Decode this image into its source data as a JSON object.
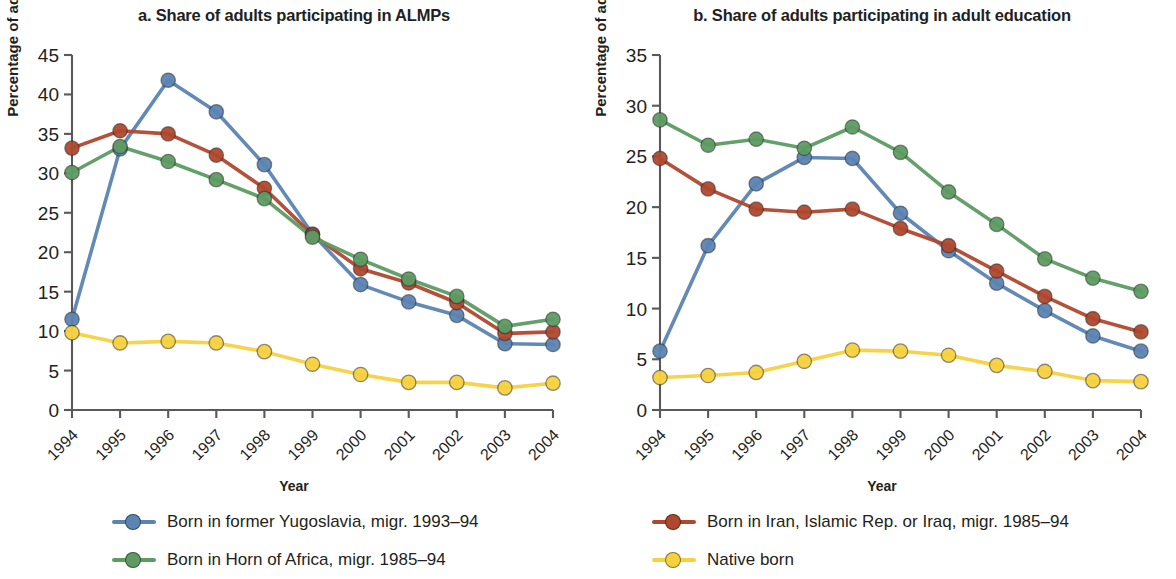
{
  "figure": {
    "background": "#ffffff",
    "xlabel": "Year",
    "ylabel": "Percentage of adults"
  },
  "series_colors": {
    "yugoslavia": "#5b84b3",
    "iran_iraq": "#b0482f",
    "horn_africa": "#5d9b63",
    "native": "#f6d13f"
  },
  "legend": {
    "items": [
      {
        "key": "yugoslavia",
        "label": "Born in former Yugoslavia, migr. 1993–94",
        "color": "#5b84b3"
      },
      {
        "key": "iran_iraq",
        "label": "Born in Iran, Islamic Rep. or Iraq, migr. 1985–94",
        "color": "#b0482f"
      },
      {
        "key": "horn_africa",
        "label": "Born in Horn of Africa, migr. 1985–94",
        "color": "#5d9b63"
      },
      {
        "key": "native",
        "label": "Native born",
        "color": "#f6d13f"
      }
    ]
  },
  "panels": [
    {
      "id": "a",
      "title": "a. Share of adults participating in ALMPs"
    },
    {
      "id": "b",
      "title": "b. Share of adults participating in adult education"
    }
  ],
  "chart_data": [
    {
      "type": "line",
      "title": "a. Share of adults participating in ALMPs",
      "xlabel": "Year",
      "ylabel": "Percentage of adults",
      "categories": [
        "1994",
        "1995",
        "1996",
        "1997",
        "1998",
        "1999",
        "2000",
        "2001",
        "2002",
        "2003",
        "2004"
      ],
      "x": [
        1994,
        1995,
        1996,
        1997,
        1998,
        1999,
        2000,
        2001,
        2002,
        2003,
        2004
      ],
      "ylim": [
        0,
        45
      ],
      "yticks": [
        0,
        5,
        10,
        15,
        20,
        25,
        30,
        35,
        40,
        45
      ],
      "grid": false,
      "legend_position": "bottom",
      "series": [
        {
          "name": "Born in former Yugoslavia, migr. 1993–94",
          "color": "#5b84b3",
          "values": [
            11.5,
            33.1,
            41.8,
            37.8,
            31.1,
            22.3,
            15.9,
            13.7,
            12.0,
            8.4,
            8.3
          ]
        },
        {
          "name": "Born in Iran, Islamic Rep. or Iraq, migr. 1985–94",
          "color": "#b0482f",
          "values": [
            33.2,
            35.4,
            35.0,
            32.3,
            28.1,
            22.2,
            17.9,
            16.1,
            13.6,
            9.7,
            9.9
          ]
        },
        {
          "name": "Born in Horn of Africa, migr. 1985–94",
          "color": "#5d9b63",
          "values": [
            30.1,
            33.4,
            31.5,
            29.2,
            26.8,
            21.9,
            19.1,
            16.6,
            14.4,
            10.6,
            11.5
          ]
        },
        {
          "name": "Native born",
          "color": "#f6d13f",
          "values": [
            9.8,
            8.5,
            8.7,
            8.5,
            7.4,
            5.8,
            4.5,
            3.5,
            3.5,
            2.8,
            3.4
          ]
        }
      ]
    },
    {
      "type": "line",
      "title": "b. Share of adults participating in adult education",
      "xlabel": "Year",
      "ylabel": "Percentage of adults",
      "categories": [
        "1994",
        "1995",
        "1996",
        "1997",
        "1998",
        "1999",
        "2000",
        "2001",
        "2002",
        "2003",
        "2004"
      ],
      "x": [
        1994,
        1995,
        1996,
        1997,
        1998,
        1999,
        2000,
        2001,
        2002,
        2003,
        2004
      ],
      "ylim": [
        0,
        35
      ],
      "yticks": [
        0,
        5,
        10,
        15,
        20,
        25,
        30,
        35
      ],
      "grid": false,
      "legend_position": "bottom",
      "series": [
        {
          "name": "Born in former Yugoslavia, migr. 1993–94",
          "color": "#5b84b3",
          "values": [
            5.8,
            16.2,
            22.3,
            24.9,
            24.8,
            19.4,
            15.7,
            12.5,
            9.8,
            7.3,
            5.8
          ]
        },
        {
          "name": "Born in Iran, Islamic Rep. or Iraq, migr. 1985–94",
          "color": "#b0482f",
          "values": [
            24.8,
            21.8,
            19.8,
            19.5,
            19.8,
            17.9,
            16.2,
            13.7,
            11.2,
            9.0,
            7.7
          ]
        },
        {
          "name": "Born in Horn of Africa, migr. 1985–94",
          "color": "#5d9b63",
          "values": [
            28.6,
            26.1,
            26.7,
            25.8,
            27.9,
            25.4,
            21.5,
            18.3,
            14.9,
            13.0,
            11.7
          ]
        },
        {
          "name": "Native born",
          "color": "#f6d13f",
          "values": [
            3.2,
            3.4,
            3.7,
            4.8,
            5.9,
            5.8,
            5.4,
            4.4,
            3.8,
            2.9,
            2.8
          ]
        }
      ]
    }
  ]
}
